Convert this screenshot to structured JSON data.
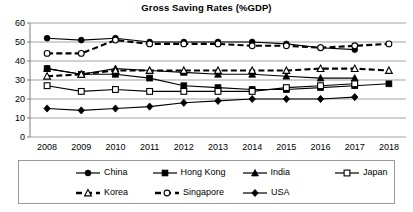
{
  "chart": {
    "title": "Gross Saving Rates (%GDP)"
  },
  "axes": {
    "y_ticks": [
      "60",
      "50",
      "40",
      "30",
      "20",
      "10",
      "0"
    ],
    "x_ticks": [
      "2008",
      "2009",
      "2010",
      "2011",
      "2012",
      "2013",
      "2014",
      "2015",
      "2016",
      "2017",
      "2018"
    ]
  },
  "legend": {
    "items": [
      {
        "label": "China",
        "key": "solid-line-filled-circle-marker"
      },
      {
        "label": "Hong Kong",
        "key": "solid-line-filled-square-marker"
      },
      {
        "label": "India",
        "key": "solid-line-filled-triangle-marker"
      },
      {
        "label": "Japan",
        "key": "solid-line-open-square-marker"
      },
      {
        "label": "Korea",
        "key": "dashed-line-open-triangle-marker"
      },
      {
        "label": "Singapore",
        "key": "dashed-line-open-circle-marker"
      },
      {
        "label": "USA",
        "key": "solid-line-filled-diamond-marker"
      }
    ]
  },
  "chart_data": {
    "type": "line",
    "title": "Gross Saving Rates (%GDP)",
    "xlabel": "",
    "ylabel": "",
    "x": [
      "2008",
      "2009",
      "2010",
      "2011",
      "2012",
      "2013",
      "2014",
      "2015",
      "2016",
      "2017",
      "2018"
    ],
    "ylim": [
      0,
      60
    ],
    "ytick_step": 10,
    "grid": true,
    "legend_position": "bottom",
    "series": [
      {
        "name": "China",
        "marker": "filled-circle",
        "line": "solid",
        "color": "#000000",
        "values": [
          52,
          51,
          52,
          50,
          50,
          50,
          50,
          49,
          47,
          46,
          null
        ]
      },
      {
        "name": "Hong Kong",
        "marker": "filled-square",
        "line": "solid",
        "color": "#000000",
        "values": [
          36,
          33,
          33,
          31,
          27,
          26,
          25,
          25,
          26,
          27,
          28
        ]
      },
      {
        "name": "India",
        "marker": "filled-triangle",
        "line": "solid",
        "color": "#000000",
        "values": [
          36,
          33,
          36,
          35,
          34,
          33,
          33,
          32,
          31,
          31,
          null
        ]
      },
      {
        "name": "Japan",
        "marker": "open-square",
        "line": "solid",
        "color": "#000000",
        "values": [
          27,
          24,
          25,
          24,
          24,
          24,
          24,
          26,
          27,
          28,
          null
        ]
      },
      {
        "name": "Korea",
        "marker": "open-triangle",
        "line": "dashed",
        "color": "#000000",
        "values": [
          32,
          33,
          35,
          35,
          35,
          35,
          35,
          35,
          36,
          36,
          35
        ]
      },
      {
        "name": "Singapore",
        "marker": "open-circle",
        "line": "dashed",
        "color": "#000000",
        "values": [
          44,
          44,
          51,
          49,
          49,
          49,
          48,
          48,
          47,
          48,
          49
        ]
      },
      {
        "name": "USA",
        "marker": "filled-diamond",
        "line": "solid",
        "color": "#000000",
        "values": [
          15,
          14,
          15,
          16,
          18,
          19,
          20,
          20,
          20,
          21,
          null
        ]
      }
    ]
  }
}
